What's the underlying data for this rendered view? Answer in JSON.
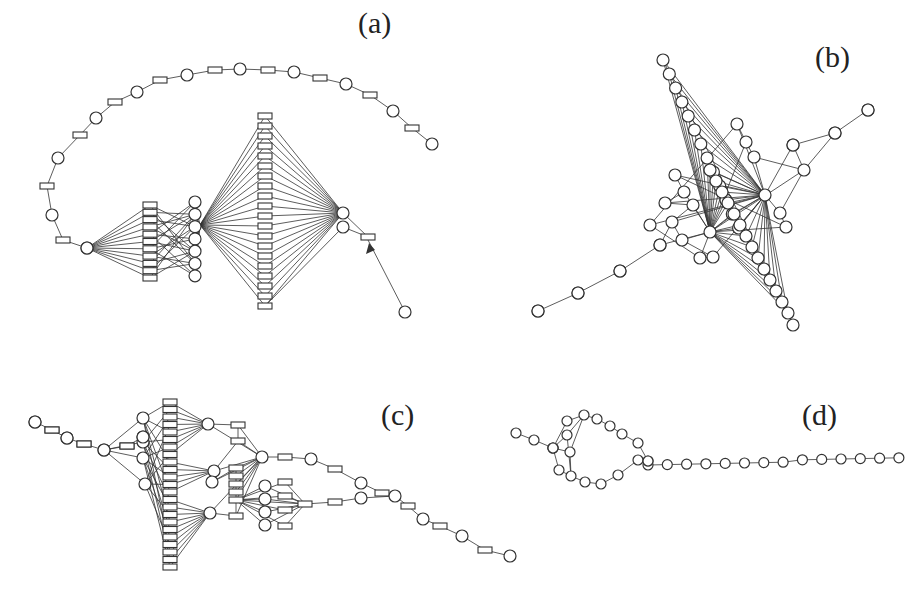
{
  "figure": {
    "panels": [
      {
        "id": "a",
        "label": "(a)",
        "label_pos": [
          358,
          6
        ]
      },
      {
        "id": "b",
        "label": "(b)",
        "label_pos": [
          815,
          40
        ]
      },
      {
        "id": "c",
        "label": "(c)",
        "label_pos": [
          381,
          398
        ]
      },
      {
        "id": "d",
        "label": "(d)",
        "label_pos": [
          802,
          398
        ]
      }
    ],
    "node_types": {
      "place": "circle",
      "transition": "rectangle"
    },
    "colors": {
      "stroke": "#333333",
      "fill": "#ffffff"
    }
  }
}
